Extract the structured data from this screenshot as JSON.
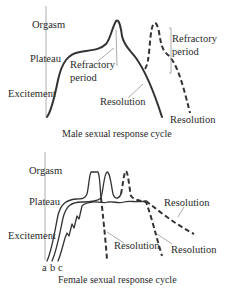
{
  "male_chart": {
    "axis_labels": {
      "orgasm": "Orgasm",
      "plateau": "Plateau",
      "excitement": "Excitement"
    },
    "annotations": {
      "refractory_1_line1": "Refractory",
      "refractory_1_line2": "period",
      "refractory_2_line1": "Refractory",
      "refractory_2_line2": "period",
      "resolution_1": "Resolution",
      "resolution_2": "Resolution"
    },
    "caption": "Male sexual response cycle"
  },
  "female_chart": {
    "axis_labels": {
      "orgasm": "Orgasm",
      "plateau": "Plateau",
      "excitement": "Excitement"
    },
    "curve_labels": {
      "a": "a",
      "b": "b",
      "c": "c"
    },
    "annotations": {
      "resolution_1": "Resolution",
      "resolution_2": "Resolution",
      "resolution_3": "Resolution"
    },
    "caption": "Female sexual response cycle"
  },
  "colors": {
    "line": "#333333",
    "axis": "#9a9a9a",
    "text": "#2a2a2a",
    "background": "#ffffff"
  }
}
